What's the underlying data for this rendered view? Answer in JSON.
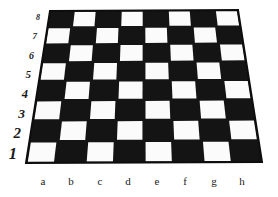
{
  "image": {
    "subject": "chessboard-in-perspective",
    "width": 278,
    "height": 197,
    "background_color": "#ffffff"
  },
  "board": {
    "light_square_color": "#fbfbfb",
    "dark_square_color": "#141414",
    "border_color": "#0d0d0d",
    "border_width_px": 2,
    "files": 8,
    "ranks": 8,
    "a1_square_color": "dark",
    "a8_square_color": "light",
    "corners": {
      "top_left": [
        50,
        11
      ],
      "top_right": [
        238,
        10
      ],
      "bottom_right": [
        262,
        162
      ],
      "bottom_left": [
        26,
        163
      ]
    }
  },
  "rank_labels": [
    {
      "text": "8",
      "x": 40,
      "y": 14,
      "size": 8
    },
    {
      "text": "7",
      "x": 37,
      "y": 32,
      "size": 9
    },
    {
      "text": "6",
      "x": 34,
      "y": 51,
      "size": 10
    },
    {
      "text": "5",
      "x": 31,
      "y": 69,
      "size": 11
    },
    {
      "text": "4",
      "x": 28,
      "y": 88,
      "size": 12.5
    },
    {
      "text": "3",
      "x": 25,
      "y": 107,
      "size": 13.5
    },
    {
      "text": "2",
      "x": 21,
      "y": 126,
      "size": 15
    },
    {
      "text": "1",
      "x": 17,
      "y": 146,
      "size": 16.5
    }
  ],
  "file_labels": [
    {
      "text": "a",
      "x": 43,
      "y": 176,
      "size": 11
    },
    {
      "text": "b",
      "x": 71,
      "y": 176,
      "size": 11
    },
    {
      "text": "c",
      "x": 100,
      "y": 176,
      "size": 11
    },
    {
      "text": "d",
      "x": 128,
      "y": 176,
      "size": 11
    },
    {
      "text": "e",
      "x": 157,
      "y": 176,
      "size": 11
    },
    {
      "text": "f",
      "x": 185,
      "y": 176,
      "size": 11
    },
    {
      "text": "g",
      "x": 214,
      "y": 176,
      "size": 11
    },
    {
      "text": "h",
      "x": 242,
      "y": 176,
      "size": 11
    }
  ]
}
